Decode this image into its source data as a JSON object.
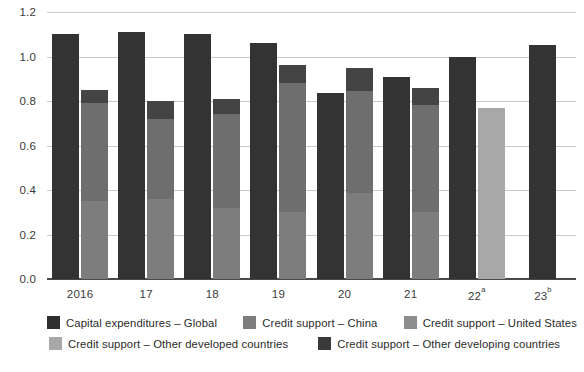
{
  "chart_data": {
    "type": "bar",
    "title": "",
    "subtitle": "",
    "xlabel": "",
    "ylabel": "",
    "ylim": [
      0.0,
      1.2
    ],
    "yticks": [
      "0.0",
      "0.2",
      "0.4",
      "0.6",
      "0.8",
      "1.0",
      "1.2"
    ],
    "ytick_values": [
      0.0,
      0.2,
      0.4,
      0.6,
      0.8,
      1.0,
      1.2
    ],
    "grid": "horizontal",
    "legend_position": "bottom",
    "categories": [
      "2016",
      "17",
      "18",
      "19",
      "20",
      "21",
      "22a",
      "23b"
    ],
    "category_labels": [
      "2016",
      "17",
      "18",
      "19",
      "20",
      "21",
      "22",
      "23"
    ],
    "category_superscripts": [
      "",
      "",
      "",
      "",
      "",
      "",
      "a",
      "b"
    ],
    "bar_groups": [
      {
        "category": "2016",
        "capex_total": 1.1,
        "credit_total": 0.85,
        "credit_segments": [
          {
            "name": "Credit support – Other developed countries",
            "value": 0.0
          },
          {
            "name": "Credit support – China",
            "value": 0.35
          },
          {
            "name": "Credit support – United States",
            "value": 0.44
          },
          {
            "name": "Credit support – Other developing countries",
            "value": 0.06
          }
        ]
      },
      {
        "category": "17",
        "capex_total": 1.11,
        "credit_total": 0.8,
        "credit_segments": [
          {
            "name": "Credit support – Other developed countries",
            "value": 0.0
          },
          {
            "name": "Credit support – China",
            "value": 0.36
          },
          {
            "name": "Credit support – United States",
            "value": 0.36
          },
          {
            "name": "Credit support – Other developing countries",
            "value": 0.08
          }
        ]
      },
      {
        "category": "18",
        "capex_total": 1.1,
        "credit_total": 0.81,
        "credit_segments": [
          {
            "name": "Credit support – Other developed countries",
            "value": 0.0
          },
          {
            "name": "Credit support – China",
            "value": 0.32
          },
          {
            "name": "Credit support – United States",
            "value": 0.42
          },
          {
            "name": "Credit support – Other developing countries",
            "value": 0.07
          }
        ]
      },
      {
        "category": "19",
        "capex_total": 1.06,
        "credit_total": 0.96,
        "credit_segments": [
          {
            "name": "Credit support – Other developed countries",
            "value": 0.0
          },
          {
            "name": "Credit support – China",
            "value": 0.3
          },
          {
            "name": "Credit support – United States",
            "value": 0.25
          },
          {
            "name": "Credit support – Other developed countries (upper)",
            "value": 0.33
          },
          {
            "name": "Credit support – Other developing countries",
            "value": 0.08
          }
        ]
      },
      {
        "category": "20",
        "capex_total": 0.835,
        "credit_total": 0.95,
        "credit_segments": [
          {
            "name": "Credit support – Other developed countries",
            "value": 0.0
          },
          {
            "name": "Credit support – China",
            "value": 0.385
          },
          {
            "name": "Credit support – United States",
            "value": 0.46
          },
          {
            "name": "Credit support – Other developing countries",
            "value": 0.105
          }
        ]
      },
      {
        "category": "21",
        "capex_total": 0.91,
        "credit_total": 0.86,
        "credit_segments": [
          {
            "name": "Credit support – Other developed countries",
            "value": 0.0
          },
          {
            "name": "Credit support – China",
            "value": 0.3
          },
          {
            "name": "Credit support – United States",
            "value": 0.48
          },
          {
            "name": "Credit support – Other developing countries",
            "value": 0.08
          }
        ]
      },
      {
        "category": "22a",
        "capex_total": 1.0,
        "credit_total": 0.77,
        "credit_segments": [
          {
            "name": "Credit support – Other developed countries",
            "value": 0.77
          },
          {
            "name": "Credit support – China",
            "value": 0.0
          },
          {
            "name": "Credit support – United States",
            "value": 0.0
          },
          {
            "name": "Credit support – Other developing countries",
            "value": 0.0
          }
        ]
      },
      {
        "category": "23b",
        "capex_total": 1.05,
        "credit_total": 0.0,
        "credit_segments": [
          {
            "name": "Credit support – Other developed countries",
            "value": 0.0
          },
          {
            "name": "Credit support – China",
            "value": 0.0
          },
          {
            "name": "Credit support – United States",
            "value": 0.0
          },
          {
            "name": "Credit support – Other developing countries",
            "value": 0.0
          }
        ]
      }
    ],
    "series": [
      {
        "name": "Capital expenditures – Global",
        "color": "#333333",
        "values": [
          1.1,
          1.11,
          1.1,
          1.06,
          0.835,
          0.91,
          1.0,
          1.05
        ]
      },
      {
        "name": "Credit support – China",
        "color": "#7d7d7d",
        "values": [
          0.35,
          0.36,
          0.32,
          0.3,
          0.385,
          0.3,
          0.0,
          0.0
        ]
      },
      {
        "name": "Credit support – United States",
        "color": "#6e6e6e",
        "values": [
          0.44,
          0.36,
          0.42,
          0.25,
          0.46,
          0.48,
          0.0,
          0.0
        ]
      },
      {
        "name": "Credit support – Other developed countries",
        "color": "#a8a8a8",
        "values": [
          0.0,
          0.0,
          0.0,
          0.33,
          0.0,
          0.0,
          0.77,
          0.0
        ]
      },
      {
        "name": "Credit support – Other developing countries",
        "color": "#444444",
        "values": [
          0.06,
          0.08,
          0.07,
          0.08,
          0.105,
          0.08,
          0.0,
          0.0
        ]
      }
    ],
    "legend": [
      {
        "label": "Capital expenditures – Global",
        "color": "#2e2e2e"
      },
      {
        "label": "Credit support – China",
        "color": "#7d7d7d"
      },
      {
        "label": "Credit support – United States",
        "color": "#8d8d8d"
      },
      {
        "label": "Credit support – Other developed countries",
        "color": "#a8a8a8"
      },
      {
        "label": "Credit support – Other developing countries",
        "color": "#3a3a3a"
      }
    ]
  },
  "colors": {
    "capex": "#333333",
    "china": "#7d7d7d",
    "united_states": "#6e6e6e",
    "other_developed": "#a8a8a8",
    "other_developing": "#444444",
    "grid": "#c9c9c9",
    "axis": "#4a4a4a",
    "text": "#2b2b2b",
    "background": "#ffffff"
  }
}
